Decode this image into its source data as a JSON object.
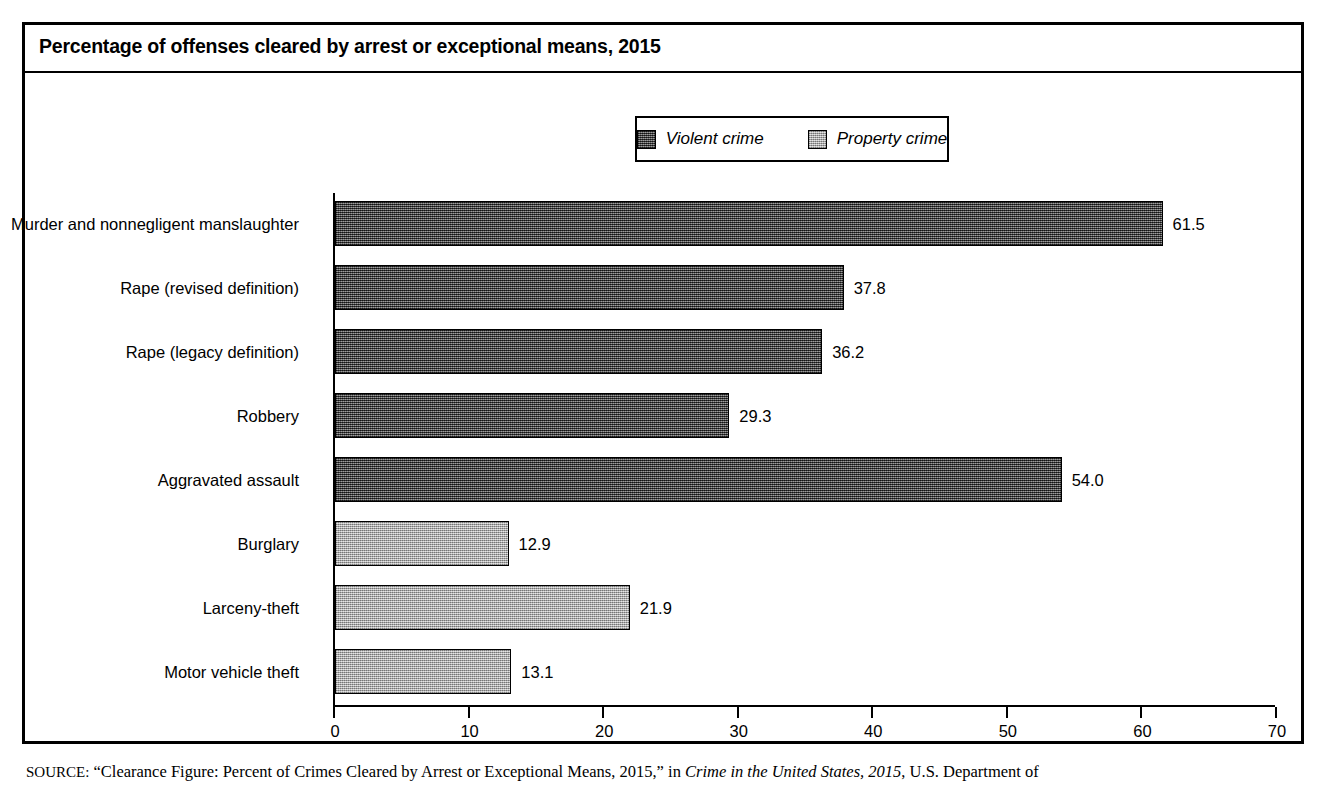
{
  "chart_data": {
    "type": "bar",
    "orientation": "horizontal",
    "title": "Percentage of offenses cleared by arrest or exceptional means, 2015",
    "xlabel": "",
    "ylabel": "",
    "xlim": [
      0,
      70
    ],
    "xticks": [
      0,
      10,
      20,
      30,
      40,
      50,
      60,
      70
    ],
    "xtick_labels": [
      "0",
      "10",
      "20",
      "30",
      "40",
      "50",
      "60",
      "70"
    ],
    "grid": false,
    "legend_position": "top-center",
    "categories": [
      "Murder and nonnegligent manslaughter",
      "Rape (revised definition)",
      "Rape (legacy definition)",
      "Robbery",
      "Aggravated assault",
      "Burglary",
      "Larceny-theft",
      "Motor vehicle theft"
    ],
    "values": [
      61.5,
      37.8,
      36.2,
      29.3,
      54.0,
      12.9,
      21.9,
      13.1
    ],
    "value_labels": [
      "61.5",
      "37.8",
      "36.2",
      "29.3",
      "54.0",
      "12.9",
      "21.9",
      "13.1"
    ],
    "series_of_bar": [
      "violent",
      "violent",
      "violent",
      "violent",
      "violent",
      "property",
      "property",
      "property"
    ],
    "legend": [
      {
        "key": "violent",
        "label": "Violent crime",
        "color": "#4b4b4b"
      },
      {
        "key": "property",
        "label": "Property crime",
        "color": "#b4b4b4"
      }
    ]
  },
  "source_note": {
    "prefix": "SOURCE:",
    "part1": " “Clearance Figure: Percent of Crimes Cleared by Arrest or Exceptional Means, 2015,” in ",
    "italic": "Crime in the United States, 2015",
    "part2": ", U.S. Department of"
  },
  "colors": {
    "frame": "#000000",
    "violent": "#4b4b4b",
    "property": "#b4b4b4",
    "background": "#ffffff"
  }
}
